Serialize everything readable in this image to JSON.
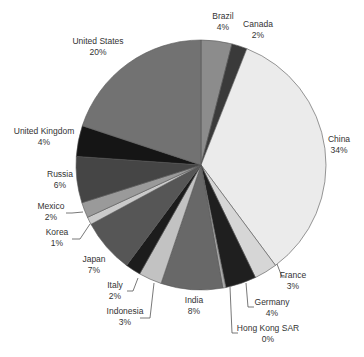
{
  "chart_data": {
    "type": "pie",
    "title": "",
    "start_angle_deg": 0,
    "direction": "clockwise",
    "center": [
      201,
      165
    ],
    "radius": 125,
    "slices": [
      {
        "label": "Brazil",
        "pct_label": "4%",
        "value": 4,
        "color": "#8c8c8c"
      },
      {
        "label": "Canada",
        "pct_label": "2%",
        "value": 2,
        "color": "#3a3a3a"
      },
      {
        "label": "China",
        "pct_label": "34%",
        "value": 34,
        "color": "#ebebeb"
      },
      {
        "label": "France",
        "pct_label": "3%",
        "value": 3,
        "color": "#d6d6d6"
      },
      {
        "label": "Germany",
        "pct_label": "4%",
        "value": 4,
        "color": "#1f1f1f"
      },
      {
        "label": "Hong Kong SAR",
        "pct_label": "0%",
        "value": 0.4,
        "color": "#a8a8a8"
      },
      {
        "label": "India",
        "pct_label": "8%",
        "value": 8,
        "color": "#686868"
      },
      {
        "label": "Indonesia",
        "pct_label": "3%",
        "value": 3,
        "color": "#c2c2c2"
      },
      {
        "label": "Italy",
        "pct_label": "2%",
        "value": 2,
        "color": "#1c1c1c"
      },
      {
        "label": "Japan",
        "pct_label": "7%",
        "value": 7,
        "color": "#565656"
      },
      {
        "label": "Korea",
        "pct_label": "1%",
        "value": 1,
        "color": "#cacaca"
      },
      {
        "label": "Mexico",
        "pct_label": "2%",
        "value": 2,
        "color": "#9a9a9a"
      },
      {
        "label": "Russia",
        "pct_label": "6%",
        "value": 6,
        "color": "#454545"
      },
      {
        "label": "United Kingdom",
        "pct_label": "4%",
        "value": 4,
        "color": "#151515"
      },
      {
        "label": "United States",
        "pct_label": "20%",
        "value": 20,
        "color": "#727272"
      }
    ],
    "legend": "none (direct labels)"
  },
  "labels": [
    {
      "name": "Brazil",
      "pct": "4%",
      "x": 223,
      "y": 19,
      "anchor": "middle"
    },
    {
      "name": "Canada",
      "pct": "2%",
      "x": 258,
      "y": 27,
      "anchor": "middle"
    },
    {
      "name": "China",
      "pct": "34%",
      "x": 339,
      "y": 142,
      "anchor": "middle"
    },
    {
      "name": "France",
      "pct": "3%",
      "x": 293,
      "y": 278,
      "anchor": "middle"
    },
    {
      "name": "Germany",
      "pct": "4%",
      "x": 272,
      "y": 305,
      "anchor": "middle"
    },
    {
      "name": "Hong Kong SAR",
      "pct": "0%",
      "x": 268,
      "y": 331,
      "anchor": "middle"
    },
    {
      "name": "India",
      "pct": "8%",
      "x": 194,
      "y": 303,
      "anchor": "middle"
    },
    {
      "name": "Indonesia",
      "pct": "3%",
      "x": 125,
      "y": 314,
      "anchor": "middle"
    },
    {
      "name": "Italy",
      "pct": "2%",
      "x": 115,
      "y": 288,
      "anchor": "middle"
    },
    {
      "name": "Japan",
      "pct": "7%",
      "x": 94,
      "y": 262,
      "anchor": "middle"
    },
    {
      "name": "Korea",
      "pct": "1%",
      "x": 57,
      "y": 235,
      "anchor": "middle"
    },
    {
      "name": "Mexico",
      "pct": "2%",
      "x": 51,
      "y": 209,
      "anchor": "middle"
    },
    {
      "name": "Russia",
      "pct": "6%",
      "x": 60,
      "y": 177,
      "anchor": "middle"
    },
    {
      "name": "United Kingdom",
      "pct": "4%",
      "x": 44,
      "y": 134,
      "anchor": "middle"
    },
    {
      "name": "United States",
      "pct": "20%",
      "x": 98,
      "y": 44,
      "anchor": "middle"
    }
  ],
  "leaders": [
    {
      "name": "France",
      "points": "277,264 282,277 286,277"
    },
    {
      "name": "Germany",
      "points": "246,283 248,307 254,307"
    },
    {
      "name": "Hong Kong SAR",
      "points": "230,287 232,333 238,333"
    },
    {
      "name": "Indonesia",
      "points": "154,283 150,318 140,318"
    },
    {
      "name": "Italy",
      "points": "138,278 133,291 127,291"
    },
    {
      "name": "Korea",
      "points": "90,224 80,239 72,239"
    },
    {
      "name": "Mexico",
      "points": "83,212 72,213 66,213"
    }
  ]
}
